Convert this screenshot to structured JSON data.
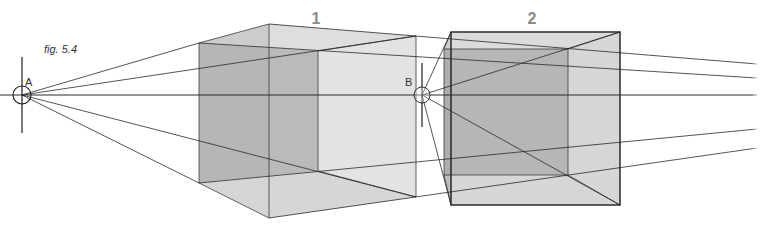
{
  "figure": {
    "caption": "fig. 5.4",
    "points": [
      {
        "id": "A",
        "label": "A",
        "x": 22,
        "y": 95,
        "r": 9,
        "cross_top": 57,
        "cross_bottom": 133,
        "label_x": 26,
        "label_y": 86
      },
      {
        "id": "B",
        "label": "B",
        "x": 422,
        "y": 95,
        "r": 8,
        "cross_top": 63,
        "cross_bottom": 127,
        "label_x": 406,
        "label_y": 86
      }
    ],
    "cubes": [
      {
        "id": "1",
        "label": "1",
        "label_x": 316,
        "label_y": 24
      },
      {
        "id": "2",
        "label": "2",
        "label_x": 532,
        "label_y": 24
      }
    ],
    "colors": {
      "line": "#2a2a2a",
      "face_dark": "#a9a9a9",
      "face_mid": "#c4c4c4",
      "face_light": "#dcdcdc",
      "label_gray": "#8a8a8a"
    }
  }
}
